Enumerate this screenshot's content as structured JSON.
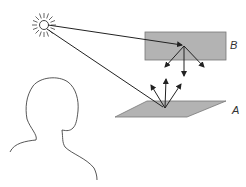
{
  "diagram": {
    "labels": {
      "surface_a": "A",
      "surface_b": "B"
    },
    "elements": {
      "light_source": "sun-icon",
      "observer": "head-silhouette",
      "surface_b": "rectangle",
      "surface_a": "parallelogram"
    },
    "colors": {
      "surface_fill": "#b3b3b3",
      "stroke": "#222222",
      "outline": "#555555",
      "background": "#ffffff"
    }
  }
}
